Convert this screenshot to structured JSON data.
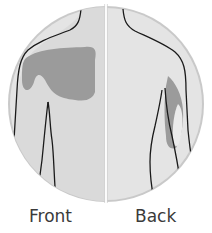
{
  "diagram": {
    "type": "body-pain-map",
    "panels": [
      {
        "label": "Front",
        "highlighted_region": "right chest / upper torso"
      },
      {
        "label": "Back",
        "highlighted_region": "back of left upper arm"
      }
    ],
    "colors": {
      "circle_bg": "#e2e2e2",
      "circle_border": "#c8c8c8",
      "body_fill": "#d9d9d9",
      "highlight": "#9a9a9a",
      "outline": "#1a1a1a",
      "divider": "#ffffff"
    }
  }
}
